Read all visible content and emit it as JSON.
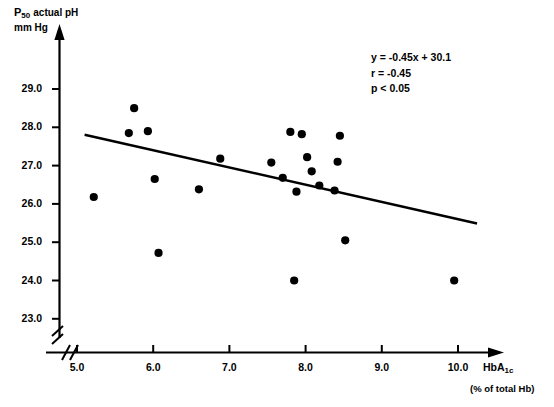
{
  "chart_data": {
    "type": "scatter",
    "title": "",
    "ylabel_line1": "P50 actual pH",
    "ylabel_line2": "mm Hg",
    "ylabel_base": "P",
    "ylabel_sub": "50",
    "ylabel_rest": "actual pH",
    "xlabel_base": "HbA",
    "xlabel_sub": "1c",
    "xlabel_note": "(% of total Hb)",
    "xlim": [
      4.7,
      10.4
    ],
    "ylim": [
      22.6,
      29.4
    ],
    "xticks": [
      5.0,
      6.0,
      7.0,
      8.0,
      9.0,
      10.0
    ],
    "xtick_labels": [
      "5.0",
      "6.0",
      "7.0",
      "8.0",
      "9.0",
      "10.0"
    ],
    "yticks": [
      23.0,
      24.0,
      25.0,
      26.0,
      27.0,
      28.0,
      29.0
    ],
    "ytick_labels": [
      "23.0",
      "24.0",
      "25.0",
      "26.0",
      "27.0",
      "28.0",
      "29.0"
    ],
    "grid": false,
    "axis_break": true,
    "marker": "filled-circle",
    "marker_color": "#000000",
    "marker_size": 7,
    "points": [
      {
        "x": 5.22,
        "y": 26.18
      },
      {
        "x": 5.68,
        "y": 27.85
      },
      {
        "x": 5.75,
        "y": 28.5
      },
      {
        "x": 5.93,
        "y": 27.9
      },
      {
        "x": 6.02,
        "y": 26.65
      },
      {
        "x": 6.07,
        "y": 24.72
      },
      {
        "x": 6.6,
        "y": 26.38
      },
      {
        "x": 6.88,
        "y": 27.18
      },
      {
        "x": 7.55,
        "y": 27.08
      },
      {
        "x": 7.7,
        "y": 26.68
      },
      {
        "x": 7.8,
        "y": 27.88
      },
      {
        "x": 7.85,
        "y": 24.0
      },
      {
        "x": 7.88,
        "y": 26.32
      },
      {
        "x": 7.95,
        "y": 27.82
      },
      {
        "x": 8.02,
        "y": 27.22
      },
      {
        "x": 8.08,
        "y": 26.85
      },
      {
        "x": 8.18,
        "y": 26.48
      },
      {
        "x": 8.38,
        "y": 26.35
      },
      {
        "x": 8.42,
        "y": 27.1
      },
      {
        "x": 8.45,
        "y": 27.78
      },
      {
        "x": 8.52,
        "y": 25.05
      },
      {
        "x": 9.95,
        "y": 24.0
      }
    ],
    "regression_line": {
      "slope": -0.45,
      "intercept": 30.1,
      "x_start": 5.1,
      "x_end": 10.25,
      "color": "#000000"
    },
    "annotation": {
      "equation": "y = -0.45x + 30.1",
      "correlation": "r = -0.45",
      "pvalue": "p < 0.05"
    }
  }
}
